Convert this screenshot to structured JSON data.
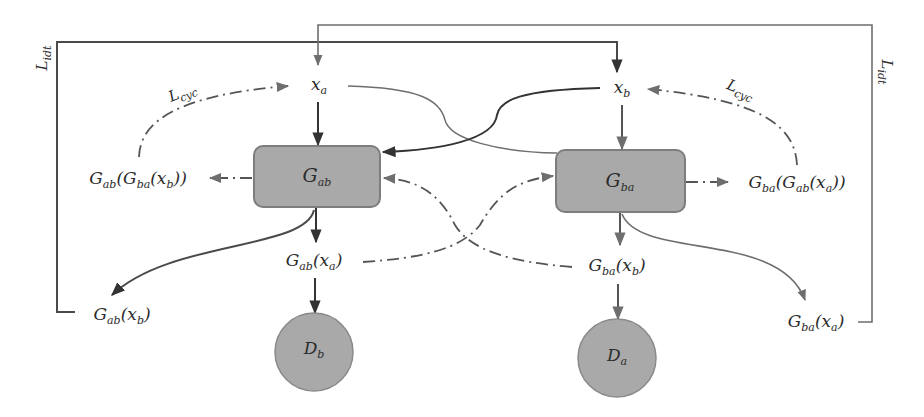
{
  "diagram": {
    "type": "CycleGAN architecture",
    "colors": {
      "node_fill": "#a9a9a9",
      "node_stroke": "#7d7d7d",
      "line_dark": "#333333",
      "line_mid": "#6e6e6e",
      "background": "#ffffff"
    },
    "inputs": {
      "x_a": {
        "base": "x",
        "sub": "a"
      },
      "x_b": {
        "base": "x",
        "sub": "b"
      }
    },
    "generators": {
      "g_ab": {
        "base": "G",
        "sub": "ab"
      },
      "g_ba": {
        "base": "G",
        "sub": "ba"
      }
    },
    "discriminators": {
      "d_b": {
        "base": "D",
        "sub": "b"
      },
      "d_a": {
        "base": "D",
        "sub": "a"
      }
    },
    "outputs": {
      "g_ab_x_a": {
        "pre": "G",
        "sub": "ab",
        "arg": "(x",
        "argsub": "a",
        "post": ")"
      },
      "g_ba_x_b": {
        "pre": "G",
        "sub": "ba",
        "arg": "(x",
        "argsub": "b",
        "post": ")"
      },
      "g_ab_x_b": {
        "pre": "G",
        "sub": "ab",
        "arg": "(x",
        "argsub": "b",
        "post": ")"
      },
      "g_ba_x_a": {
        "pre": "G",
        "sub": "ba",
        "arg": "(x",
        "argsub": "a",
        "post": ")"
      }
    },
    "reconstructions": {
      "g_ab_g_ba_x_b": {
        "outer": "G",
        "outer_sub": "ab",
        "inner": "(G",
        "inner_sub": "ba",
        "arg": "(x",
        "argsub": "b",
        "post": "))"
      },
      "g_ba_g_ab_x_a": {
        "outer": "G",
        "outer_sub": "ba",
        "inner": "(G",
        "inner_sub": "ab",
        "arg": "(x",
        "argsub": "a",
        "post": "))"
      }
    },
    "losses": {
      "l_cyc_left": {
        "base": "L",
        "sub": "cyc"
      },
      "l_cyc_right": {
        "base": "L",
        "sub": "cyc"
      },
      "l_idt_left": {
        "base": "L",
        "sub": "idt"
      },
      "l_idt_right": {
        "base": "L",
        "sub": "idt"
      }
    }
  }
}
